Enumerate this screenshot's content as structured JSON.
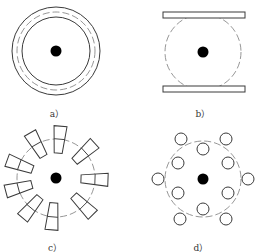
{
  "figure": {
    "panels": [
      {
        "id": "a",
        "label": "a）",
        "label_pos": [
          57,
          107
        ],
        "center": [
          56,
          51
        ],
        "outer_circle_r": 44,
        "dashed_circle_r": 39,
        "inner_circle_r": 34,
        "dot_r": 5.5
      },
      {
        "id": "b",
        "label": "b）",
        "label_pos": [
          203,
          107
        ],
        "center": [
          203,
          52
        ],
        "dashed_circle_r": 38,
        "dot_r": 5.5,
        "plates": [
          {
            "x": 163,
            "y": 12,
            "w": 82,
            "h": 6
          },
          {
            "x": 163,
            "y": 86,
            "w": 82,
            "h": 6
          }
        ]
      },
      {
        "id": "c",
        "label": "c）",
        "label_pos": [
          55,
          241
        ],
        "center": [
          56,
          178
        ],
        "dashed_circle_r": 39,
        "dot_r": 5.5,
        "blade": {
          "r_in": 25,
          "r_out": 52,
          "w_in": 8,
          "w_out": 13
        },
        "blade_angles_deg": [
          2,
          45,
          95,
          130,
          165,
          200,
          240,
          275,
          318
        ]
      },
      {
        "id": "d",
        "label": "d）",
        "label_pos": [
          201,
          241
        ],
        "center": [
          203,
          179
        ],
        "dashed_circle_r": 38,
        "dot_r": 5.5,
        "small_circle_r": 6,
        "small_circles": [
          [
            181,
            139
          ],
          [
            226,
            139
          ],
          [
            158,
            179
          ],
          [
            248,
            179
          ],
          [
            180,
            219
          ],
          [
            226,
            219
          ],
          [
            203,
            149
          ],
          [
            178,
            163
          ],
          [
            228,
            163
          ],
          [
            178,
            193
          ],
          [
            228,
            193
          ],
          [
            203,
            209
          ]
        ]
      }
    ],
    "colors": {
      "line": "#3a3a3a",
      "dashed": "#8a8a8a",
      "dot": "#000000"
    }
  }
}
